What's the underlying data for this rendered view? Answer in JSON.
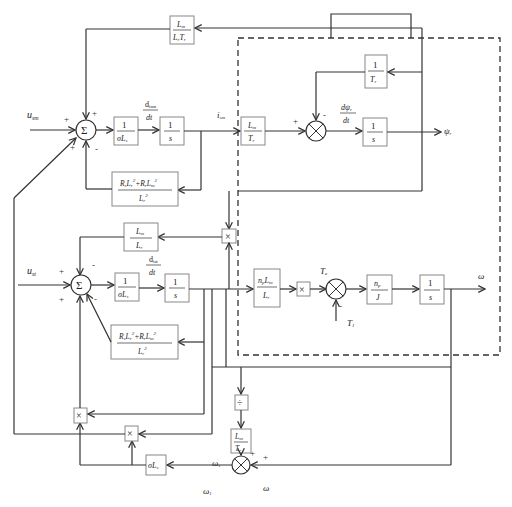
{
  "diagram": {
    "type": "block-diagram",
    "title": "",
    "inputs": {
      "u_sm": "u",
      "u_sm_sub": "sm",
      "u_st": "u",
      "u_st_sub": "st"
    },
    "outputs": {
      "psi_r": "ψ",
      "psi_r_sub": "r",
      "omega": "ω"
    },
    "signals": {
      "i_sm": "i",
      "i_sm_sub": "sm",
      "d_ism_num": "d",
      "d_ism_num_sub": "ism",
      "d_ism_den": "dt",
      "d_ist_num": "d",
      "d_ist_num_sub": "ist",
      "d_ist_den": "dt",
      "dpsi_num": "dψ",
      "dpsi_num_sub": "r",
      "dpsi_den": "dt",
      "Te": "T",
      "Te_sub": "e",
      "Tl": "T",
      "Tl_sub": "1",
      "omega_s": "ω",
      "omega_s_sub": "s",
      "omega_1": "ω",
      "omega_1_sub": "1",
      "omega_fb": "ω"
    },
    "blocks": {
      "lm_lrtr": {
        "num": "L",
        "num_sub": "m",
        "den": "L",
        "den_sub": "r",
        "den2": "T",
        "den2_sub": "r"
      },
      "inv_sigma_ls_top": {
        "num": "1",
        "den": "σL",
        "den_sub": "s"
      },
      "integrator_top": {
        "num": "1",
        "den": "s"
      },
      "rs_top": {
        "num": "R",
        "num_sub": "s",
        "num_mid": "L",
        "num_mid_sub": "r",
        "num_sup": "2",
        "plus": "+R",
        "plus_sub": "r",
        "num_end": "L",
        "num_end_sub": "m",
        "num_end_sup": "2",
        "den": "L",
        "den_sub": "r",
        "den_sup": "2"
      },
      "lm_tr_top": {
        "num": "L",
        "num_sub": "m",
        "den": "T",
        "den_sub": "r"
      },
      "inv_tr": {
        "num": "1",
        "den": "T",
        "den_sub": "r"
      },
      "integrator_psi": {
        "num": "1",
        "den": "s"
      },
      "lm_lr_mid": {
        "num": "L",
        "num_sub": "m",
        "den": "L",
        "den_sub": "r"
      },
      "inv_sigma_ls_bot": {
        "num": "1",
        "den": "σL",
        "den_sub": "s"
      },
      "integrator_bot": {
        "num": "1",
        "den": "s"
      },
      "rs_bot": {
        "num": "R",
        "num_sub": "s",
        "num_mid": "L",
        "num_mid_sub": "r",
        "num_sup": "2",
        "plus": "+R",
        "plus_sub": "r",
        "num_end": "L",
        "num_end_sub": "m",
        "num_end_sup": "2",
        "den": "L",
        "den_sub": "r",
        "den_sup": "2"
      },
      "np_lm_lr": {
        "num": "n",
        "num_sub": "p",
        "num2": "L",
        "num2_sub": "m",
        "den": "L",
        "den_sub": "r"
      },
      "np_j": {
        "num": "n",
        "num_sub": "p",
        "den": "J"
      },
      "integrator_omega": {
        "num": "1",
        "den": "s"
      },
      "lm_tr_bot": {
        "num": "L",
        "num_sub": "m",
        "den": "T",
        "den_sub": "r"
      },
      "sigma_ls": {
        "label": "σL",
        "label_sub": "s"
      }
    },
    "operators": {
      "sum": "Σ",
      "multiply": "×",
      "divide": "÷"
    },
    "signs": {
      "plus": "+",
      "minus": "-"
    }
  }
}
